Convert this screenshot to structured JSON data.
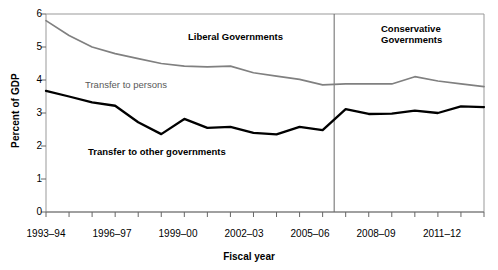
{
  "chart_data": {
    "type": "line",
    "title": "",
    "xlabel": "Fiscal year",
    "ylabel": "Percent of GDP",
    "ylim": [
      0,
      6
    ],
    "yticks": [
      0,
      1,
      2,
      3,
      4,
      5,
      6
    ],
    "ytick_labels": [
      "0",
      "1",
      "2",
      "3",
      "4",
      "5",
      "6"
    ],
    "grid": false,
    "legend_position": "inline-annotations",
    "x": [
      "1993-94",
      "1994-95",
      "1995-96",
      "1996-97",
      "1997-98",
      "1998-99",
      "1999-00",
      "2000-01",
      "2001-02",
      "2002-03",
      "2003-04",
      "2004-05",
      "2005-06",
      "2006-07",
      "2007-08",
      "2008-09",
      "2009-10",
      "2010-11",
      "2011-12",
      "2012-13"
    ],
    "xtick_labels": [
      "1993-94",
      "1996-97",
      "1999-00",
      "2002-03",
      "2005-06",
      "2008-09",
      "2011-12"
    ],
    "xtick_label_indices": [
      0,
      3,
      6,
      9,
      12,
      15,
      18
    ],
    "series": [
      {
        "name": "Transfer to persons",
        "color": "#808080",
        "values": [
          5.8,
          5.35,
          5.0,
          4.8,
          4.65,
          4.5,
          4.42,
          4.4,
          4.42,
          4.22,
          4.12,
          4.02,
          3.85,
          3.88,
          3.88,
          3.88,
          4.1,
          3.97,
          3.88,
          3.8
        ]
      },
      {
        "name": "Transfer to other governments",
        "color": "#000000",
        "values": [
          3.67,
          3.5,
          3.32,
          3.22,
          2.72,
          2.36,
          2.82,
          2.55,
          2.58,
          2.4,
          2.35,
          2.58,
          2.48,
          3.12,
          2.97,
          2.98,
          3.07,
          3.0,
          3.2,
          3.18
        ]
      }
    ],
    "annotations": [
      {
        "name": "liberal-governments",
        "text": "Liberal Governments",
        "x_pct": 0.47,
        "y_value": 5.2
      },
      {
        "name": "conservative-governments",
        "text": "Conservative\nGovernments",
        "x_pct": 0.87,
        "y_value": 5.35
      }
    ],
    "divider": {
      "name": "government-change-divider",
      "x_index": 12.5,
      "color": "#666666"
    },
    "series_labels": [
      {
        "name": "transfer-to-persons-label",
        "text": "Transfer to persons",
        "color": "#595959"
      },
      {
        "name": "transfer-to-other-governments-label",
        "text": "Transfer to other governments",
        "color": "#000000"
      }
    ]
  },
  "annotations": {
    "liberal": "Liberal Governments",
    "conservative_line1": "Conservative",
    "conservative_line2": "Governments"
  },
  "labels": {
    "ylabel": "Percent of GDP",
    "xlabel": "Fiscal year",
    "transfer_persons": "Transfer to persons",
    "transfer_other_gov": "Transfer to other governments"
  },
  "yticks": {
    "t0": "0",
    "t1": "1",
    "t2": "2",
    "t3": "3",
    "t4": "4",
    "t5": "5",
    "t6": "6"
  },
  "xticks": {
    "x0": "1993–94",
    "x1": "1996–97",
    "x2": "1999–00",
    "x3": "2002–03",
    "x4": "2005–06",
    "x5": "2008–09",
    "x6": "2011–12"
  }
}
